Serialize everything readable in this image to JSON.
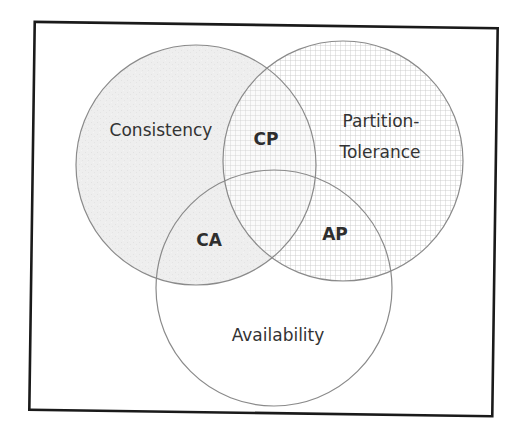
{
  "diagram": {
    "sets": [
      {
        "id": "consistency",
        "label": "Consistency",
        "fill": "speckled-light-gray"
      },
      {
        "id": "partition",
        "label_line1": "Partition-",
        "label_line2": "Tolerance",
        "fill": "grid-pattern"
      },
      {
        "id": "availability",
        "label": "Availability",
        "fill": "white"
      }
    ],
    "intersections": [
      {
        "id": "cp",
        "label": "CP",
        "sets": [
          "consistency",
          "partition"
        ]
      },
      {
        "id": "ca",
        "label": "CA",
        "sets": [
          "consistency",
          "availability"
        ]
      },
      {
        "id": "ap",
        "label": "AP",
        "sets": [
          "availability",
          "partition"
        ]
      }
    ],
    "colors": {
      "frame": "#1a1a1a",
      "circle_stroke": "#8a8a8a",
      "consistency_fill": "#ececec",
      "grid_line": "#bdbdbd",
      "text": "#333333"
    }
  }
}
